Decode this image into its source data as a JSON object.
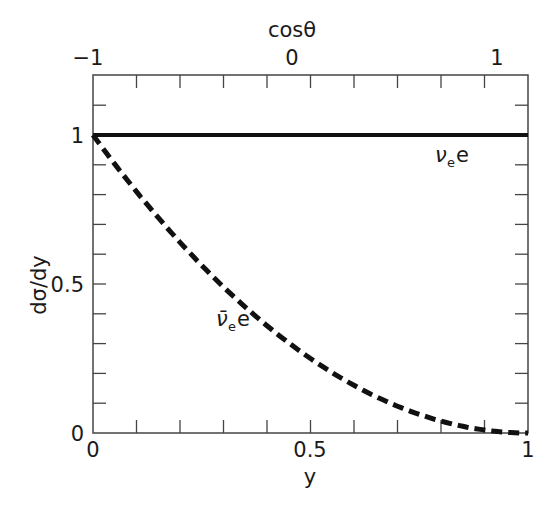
{
  "chart_data": {
    "type": "line",
    "title": "",
    "xlabel": "y",
    "ylabel": "dσ/dy",
    "top_xlabel": "cosθ",
    "xlim": [
      0,
      1
    ],
    "ylim": [
      0,
      1.2
    ],
    "top_xlim": [
      -1,
      1
    ],
    "grid": false,
    "legend": "none (inline curve labels)",
    "x_ticks": [
      "0",
      "0.5",
      "1"
    ],
    "y_ticks": [
      "0",
      "0.5",
      "1"
    ],
    "top_x_ticks": [
      "−1",
      "0",
      "1"
    ],
    "x": [
      0,
      0.1,
      0.2,
      0.3,
      0.4,
      0.5,
      0.6,
      0.7,
      0.8,
      0.9,
      1.0
    ],
    "series": [
      {
        "name": "νe e",
        "style": "solid",
        "values": [
          1,
          1,
          1,
          1,
          1,
          1,
          1,
          1,
          1,
          1,
          1
        ]
      },
      {
        "name": "ν̄e e",
        "style": "dashed",
        "values": [
          1,
          0.81,
          0.64,
          0.49,
          0.36,
          0.25,
          0.16,
          0.09,
          0.04,
          0.01,
          0
        ]
      }
    ]
  },
  "labels": {
    "xlabel": "y",
    "ylabel": "dσ/dy",
    "top_xlabel": "cosθ",
    "x_tick_0": "0",
    "x_tick_05": "0.5",
    "x_tick_1": "1",
    "y_tick_0": "0",
    "y_tick_05": "0.5",
    "y_tick_1": "1",
    "top_tick_m1": "−1",
    "top_tick_0": "0",
    "top_tick_1": "1",
    "curve1_main": "ν",
    "curve1_sub": "e",
    "curve1_tail": "e",
    "curve2_main": "ν̄",
    "curve2_sub": "e",
    "curve2_tail": "e"
  }
}
